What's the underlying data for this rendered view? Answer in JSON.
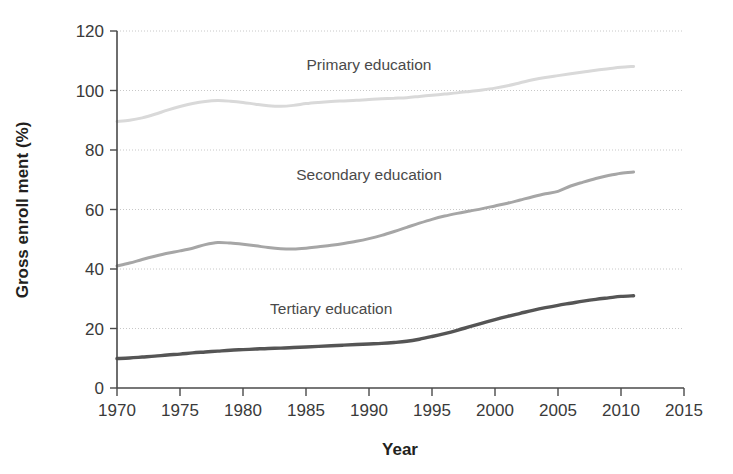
{
  "chart_data": {
    "type": "line",
    "title": "",
    "xlabel": "Year",
    "ylabel": "Gross enroll ment (%)",
    "xlim": [
      1970,
      2015
    ],
    "ylim": [
      0,
      120
    ],
    "xticks": [
      1970,
      1975,
      1980,
      1985,
      1990,
      1995,
      2000,
      2005,
      2010,
      2015
    ],
    "yticks": [
      0,
      20,
      40,
      60,
      80,
      100,
      120
    ],
    "grid": "horizontal-dotted",
    "legend_position": "inline-annotations",
    "series": [
      {
        "name": "Primary education",
        "color": "#d9d9d9",
        "label_x": 1990,
        "label_y": 107,
        "x": [
          1970,
          1971,
          1972,
          1973,
          1974,
          1975,
          1976,
          1977,
          1978,
          1979,
          1980,
          1981,
          1982,
          1983,
          1984,
          1985,
          1986,
          1987,
          1988,
          1989,
          1990,
          1991,
          1992,
          1993,
          1994,
          1995,
          1996,
          1997,
          1998,
          1999,
          2000,
          2001,
          2002,
          2003,
          2004,
          2005,
          2006,
          2007,
          2008,
          2009,
          2010,
          2011
        ],
        "values": [
          89.6,
          90.0,
          90.8,
          92.0,
          93.4,
          94.6,
          95.6,
          96.3,
          96.6,
          96.4,
          96.0,
          95.4,
          94.9,
          94.7,
          95.0,
          95.6,
          96.0,
          96.3,
          96.5,
          96.7,
          97.0,
          97.2,
          97.4,
          97.6,
          98.0,
          98.4,
          98.8,
          99.2,
          99.7,
          100.2,
          100.8,
          101.6,
          102.6,
          103.6,
          104.4,
          105.0,
          105.6,
          106.2,
          106.8,
          107.3,
          107.8,
          108.1
        ]
      },
      {
        "name": "Secondary education",
        "color": "#a6a6a6",
        "label_x": 1990,
        "label_y": 70,
        "x": [
          1970,
          1971,
          1972,
          1973,
          1974,
          1975,
          1976,
          1977,
          1978,
          1979,
          1980,
          1981,
          1982,
          1983,
          1984,
          1985,
          1986,
          1987,
          1988,
          1989,
          1990,
          1991,
          1992,
          1993,
          1994,
          1995,
          1996,
          1997,
          1998,
          1999,
          2000,
          2001,
          2002,
          2003,
          2004,
          2005,
          2006,
          2007,
          2008,
          2009,
          2010,
          2011
        ],
        "values": [
          41.0,
          42.0,
          43.2,
          44.3,
          45.3,
          46.1,
          47.0,
          48.2,
          48.9,
          48.7,
          48.3,
          47.8,
          47.2,
          46.8,
          46.7,
          47.0,
          47.5,
          48.0,
          48.6,
          49.3,
          50.2,
          51.3,
          52.6,
          54.0,
          55.4,
          56.7,
          57.8,
          58.7,
          59.5,
          60.3,
          61.2,
          62.1,
          63.2,
          64.3,
          65.3,
          66.1,
          67.9,
          69.2,
          70.4,
          71.4,
          72.2,
          72.6
        ]
      },
      {
        "name": "Tertiary education",
        "color": "#555555",
        "label_x": 1987,
        "label_y": 25,
        "x": [
          1970,
          1971,
          1972,
          1973,
          1974,
          1975,
          1976,
          1977,
          1978,
          1979,
          1980,
          1981,
          1982,
          1983,
          1984,
          1985,
          1986,
          1987,
          1988,
          1989,
          1990,
          1991,
          1992,
          1993,
          1994,
          1995,
          1996,
          1997,
          1998,
          1999,
          2000,
          2001,
          2002,
          2003,
          2004,
          2005,
          2006,
          2007,
          2008,
          2009,
          2010,
          2011
        ],
        "values": [
          9.9,
          10.1,
          10.4,
          10.7,
          11.1,
          11.4,
          11.8,
          12.1,
          12.4,
          12.7,
          12.9,
          13.1,
          13.3,
          13.4,
          13.6,
          13.8,
          14.0,
          14.2,
          14.4,
          14.6,
          14.8,
          15.0,
          15.3,
          15.7,
          16.4,
          17.3,
          18.3,
          19.4,
          20.6,
          21.8,
          23.0,
          24.1,
          25.1,
          26.1,
          27.0,
          27.8,
          28.5,
          29.2,
          29.8,
          30.3,
          30.8,
          31.0
        ]
      }
    ]
  }
}
